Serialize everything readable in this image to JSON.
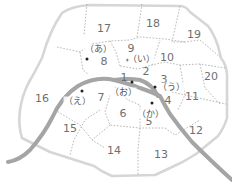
{
  "map": {
    "title": "Paris arrondissements",
    "colors": {
      "outline": "#d6d6d6",
      "river": "#a5a5a5",
      "borders": "#9a9a9a",
      "text": "#6f6f6f"
    },
    "arrondissements": [
      {
        "label": "1",
        "x": 124,
        "y": 77
      },
      {
        "label": "2",
        "x": 146,
        "y": 71
      },
      {
        "label": "3",
        "x": 164,
        "y": 79
      },
      {
        "label": "4",
        "x": 168,
        "y": 100
      },
      {
        "label": "5",
        "x": 149,
        "y": 121
      },
      {
        "label": "6",
        "x": 123,
        "y": 113
      },
      {
        "label": "7",
        "x": 101,
        "y": 97
      },
      {
        "label": "8",
        "x": 104,
        "y": 61
      },
      {
        "label": "9",
        "x": 131,
        "y": 48
      },
      {
        "label": "10",
        "x": 167,
        "y": 57
      },
      {
        "label": "11",
        "x": 192,
        "y": 96
      },
      {
        "label": "12",
        "x": 196,
        "y": 130
      },
      {
        "label": "13",
        "x": 161,
        "y": 154
      },
      {
        "label": "14",
        "x": 114,
        "y": 150
      },
      {
        "label": "15",
        "x": 70,
        "y": 128
      },
      {
        "label": "16",
        "x": 42,
        "y": 98
      },
      {
        "label": "17",
        "x": 104,
        "y": 28
      },
      {
        "label": "18",
        "x": 153,
        "y": 23
      },
      {
        "label": "19",
        "x": 194,
        "y": 34
      },
      {
        "label": "20",
        "x": 211,
        "y": 76
      }
    ],
    "markers": [
      {
        "label": "（あ）",
        "x": 98,
        "y": 49,
        "dot_x": 87,
        "dot_y": 59
      },
      {
        "label": "（い）",
        "x": 141,
        "y": 59,
        "dot_x": 128,
        "dot_y": 60
      },
      {
        "label": "（う）",
        "x": 171,
        "y": 87,
        "dot_x": 155,
        "dot_y": 87
      },
      {
        "label": "（え）",
        "x": 77,
        "y": 101,
        "dot_x": 82,
        "dot_y": 91
      },
      {
        "label": "（お）",
        "x": 123,
        "y": 92,
        "dot_x": 132,
        "dot_y": 82
      },
      {
        "label": "（か）",
        "x": 150,
        "y": 114,
        "dot_x": 152,
        "dot_y": 103
      }
    ]
  }
}
